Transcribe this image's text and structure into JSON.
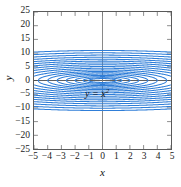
{
  "chart_data": {
    "type": "line",
    "title": "",
    "subtitle": "",
    "xlabel": "x",
    "ylabel": "y",
    "xlim": [
      -5,
      5
    ],
    "ylim": [
      -25,
      25
    ],
    "xticks": [
      "-5",
      "-4",
      "-3",
      "-2",
      "-1",
      "0",
      "1",
      "2",
      "3",
      "4",
      "5"
    ],
    "xtick_values": [
      -5,
      -4,
      -3,
      -2,
      -1,
      0,
      1,
      2,
      3,
      4,
      5
    ],
    "yticks": [
      "25",
      "20",
      "15",
      "10",
      "5",
      "0",
      "-5",
      "-10",
      "-15",
      "-20",
      "-25"
    ],
    "ytick_values": [
      25,
      20,
      15,
      10,
      5,
      0,
      -5,
      -10,
      -15,
      -20,
      -25
    ],
    "grid": false,
    "legend": null,
    "annotations": [
      {
        "text_head": "y = x",
        "text_sup": "2",
        "full_text": "y = x²",
        "x": -0.45,
        "y": -1.5
      }
    ],
    "curve_color": "#2f7ed8",
    "axis_color": "#5a5a5a",
    "series_description": "family of orthogonal trajectories of y = x^2, i.e. curves x^2/2 + y^2 = C",
    "series": [
      {
        "name": "C = 0.5",
        "constant": 0.5
      },
      {
        "name": "C = 1",
        "constant": 1
      },
      {
        "name": "C = 2",
        "constant": 2
      },
      {
        "name": "C = 3.5",
        "constant": 3.5
      },
      {
        "name": "C = 5.5",
        "constant": 5.5
      },
      {
        "name": "C = 8",
        "constant": 8
      },
      {
        "name": "C = 11",
        "constant": 11
      },
      {
        "name": "C = 15",
        "constant": 15
      },
      {
        "name": "C = 20",
        "constant": 20
      },
      {
        "name": "C = 26",
        "constant": 26
      },
      {
        "name": "C = 33",
        "constant": 33
      },
      {
        "name": "C = 41",
        "constant": 41
      },
      {
        "name": "C = 50",
        "constant": 50
      },
      {
        "name": "C = 60",
        "constant": 60
      },
      {
        "name": "C = 72",
        "constant": 72
      },
      {
        "name": "C = 86",
        "constant": 86
      },
      {
        "name": "C = 102",
        "constant": 102
      },
      {
        "name": "C = 120",
        "constant": 120
      }
    ]
  }
}
